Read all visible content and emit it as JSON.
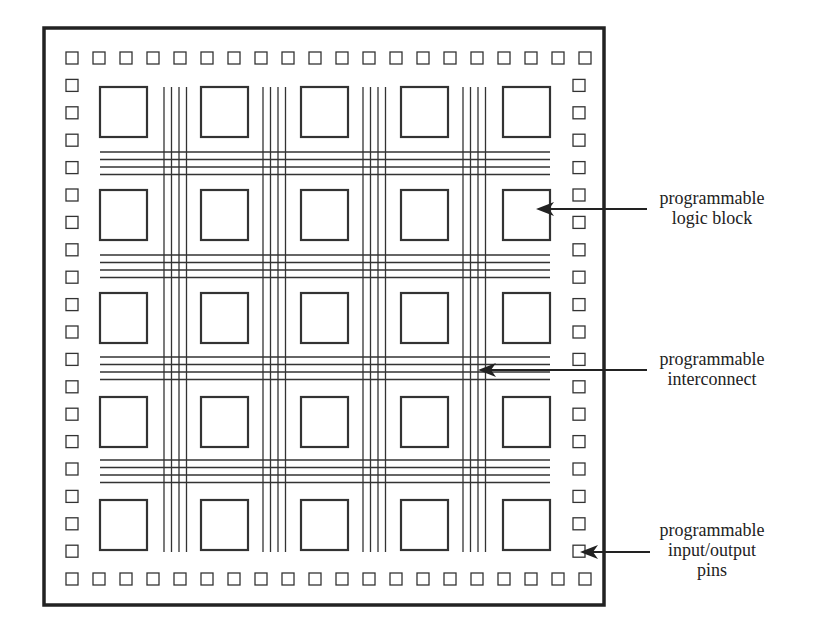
{
  "diagram": {
    "colors": {
      "background": "#ffffff",
      "stroke": "#333333",
      "border": "#222222",
      "text": "#222222"
    },
    "chip": {
      "border": {
        "x": 44,
        "y": 28,
        "width": 560,
        "height": 577,
        "stroke_width": 3.5
      },
      "io_pins": {
        "count_per_side": 20,
        "size": 12,
        "top_row_y": 52,
        "bottom_row_y": 573,
        "left_col_x": 66,
        "right_col_x": 573,
        "start": 52,
        "spacing_x": 27.0,
        "spacing_y": 27.4,
        "start_x": 66
      },
      "logic_blocks": {
        "rows": 5,
        "cols": 5,
        "col_x": [
          100,
          201,
          301,
          401,
          503
        ],
        "row_y": [
          87,
          190,
          293,
          397,
          500
        ],
        "width": 47,
        "height": 50
      },
      "interconnect": {
        "vertical_groups_x": [
          164,
          263,
          363,
          463
        ],
        "vertical_line_offsets": [
          0,
          7.5,
          15,
          22.5
        ],
        "vertical_y_range": [
          87,
          552
        ],
        "horizontal_groups_y": [
          152,
          255,
          357,
          460
        ],
        "horizontal_line_offsets": [
          0,
          7.5,
          15,
          22.5
        ],
        "horizontal_x_range": [
          100,
          550
        ]
      }
    },
    "annotations": [
      {
        "id": "logic-block",
        "lines": [
          "programmable",
          "logic block"
        ],
        "arrow": {
          "from_x": 647,
          "to_x": 536,
          "y": 209
        },
        "label_center_x": 712,
        "label_top_y": 188
      },
      {
        "id": "interconnect",
        "lines": [
          "programmable",
          "interconnect"
        ],
        "arrow": {
          "from_x": 647,
          "to_x": 478,
          "y": 370
        },
        "label_center_x": 712,
        "label_top_y": 349
      },
      {
        "id": "io-pins",
        "lines": [
          "programmable",
          "input/output",
          "pins"
        ],
        "arrow": {
          "from_x": 650,
          "to_x": 580,
          "y": 552
        },
        "label_center_x": 712,
        "label_top_y": 520
      }
    ]
  }
}
